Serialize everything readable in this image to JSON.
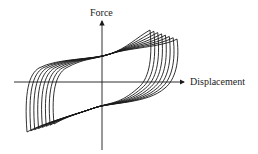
{
  "diagram": {
    "type": "hysteresis-loops",
    "y_axis_label": "Force",
    "x_axis_label": "Displacement",
    "loop_count": 8,
    "line_color": "#1a1a1a",
    "background": "#ffffff"
  }
}
